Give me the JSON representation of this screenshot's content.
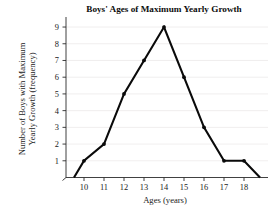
{
  "chart_data": {
    "type": "line",
    "title": "Boys' Ages of Maximum Yearly Growth",
    "xlabel": "Ages (years)",
    "ylabel": "Number of Boys with Maximum Yearly Growth (frequency)",
    "ylabel_line1": "Number of Boys with Maximum",
    "ylabel_line2": "Yearly Growth (frequency)",
    "x": [
      9.5,
      10,
      11,
      12,
      13,
      14,
      15,
      16,
      17,
      18,
      18.8
    ],
    "values": [
      0,
      1,
      2,
      5,
      7,
      9,
      6,
      3,
      1,
      1,
      0
    ],
    "markers_x": [
      10,
      11,
      12,
      13,
      14,
      15,
      16,
      17,
      18
    ],
    "markers_y": [
      1,
      2,
      5,
      7,
      9,
      6,
      3,
      1,
      1
    ],
    "xticks": [
      10,
      11,
      12,
      13,
      14,
      15,
      16,
      17,
      18
    ],
    "xtick_labels": [
      "10",
      "11",
      "12",
      "13",
      "14",
      "15",
      "16",
      "17",
      "18"
    ],
    "yticks": [
      1,
      2,
      3,
      4,
      5,
      6,
      7,
      8,
      9
    ],
    "ytick_labels": [
      "1",
      "2",
      "3",
      "4",
      "5",
      "6",
      "7",
      "8",
      "9"
    ],
    "xlim": [
      9.1,
      19.2
    ],
    "ylim": [
      0,
      9.6
    ],
    "grid": "horizontal",
    "legend": "none",
    "line_color": "#0a0a0a",
    "grid_color": "#eceaea",
    "axis_color": "#2b2b2b",
    "background": "#ffffff"
  }
}
